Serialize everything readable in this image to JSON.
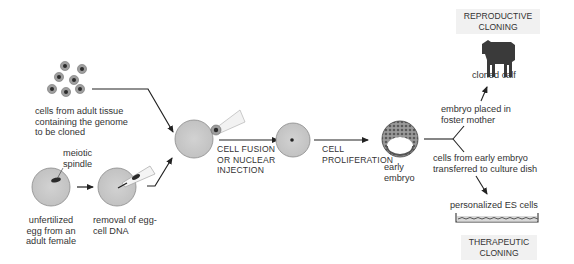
{
  "labels": {
    "adult_cells": [
      "cells from adult tissue",
      "containing the genome",
      "to be cloned"
    ],
    "meiotic_spindle": [
      "meiotic",
      "spindle"
    ],
    "unfertilized_egg": [
      "unfertilized",
      "egg from an",
      "adult female"
    ],
    "removal_dna": [
      "removal of egg-",
      "cell DNA"
    ],
    "fusion_step": [
      "CELL FUSION",
      "OR NUCLEAR",
      "INJECTION"
    ],
    "proliferation_step": [
      "CELL",
      "PROLIFERATION"
    ],
    "early_embryo": [
      "early",
      "embryo"
    ],
    "foster": [
      "embryo placed in",
      "foster mother"
    ],
    "cloned_calf": "cloned calf",
    "culture": [
      "cells from early embryo",
      "transferred to culture dish"
    ],
    "es_cells": "personalized ES cells"
  },
  "banners": {
    "reproductive": [
      "REPRODUCTIVE",
      "CLONING"
    ],
    "therapeutic": [
      "THERAPEUTIC",
      "CLONING"
    ]
  },
  "colors": {
    "cell_fill": "#c8c8c8",
    "cell_stroke": "#888888",
    "nucleus": "#333333",
    "arrow": "#222222",
    "banner_bg": "#f1f1f1"
  }
}
